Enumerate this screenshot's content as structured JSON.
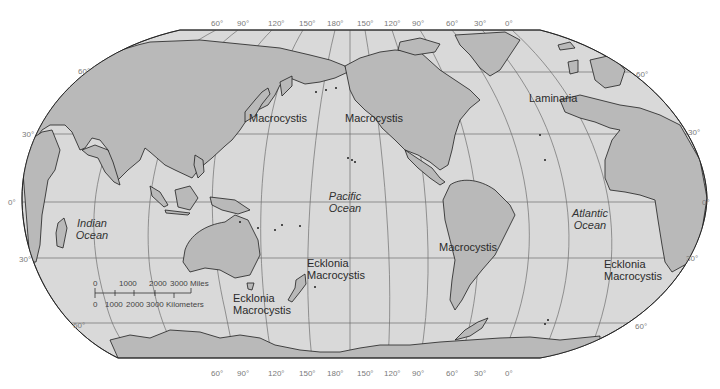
{
  "colors": {
    "ocean": "#d9d9d9",
    "land": "#b9b9b9",
    "coast": "#1e1e1e",
    "graticule": "#6e6e6e",
    "background": "#ffffff",
    "label": "#2a2a2a",
    "tick": "#7a7a7a"
  },
  "top_longitudes": [
    {
      "label": "60°",
      "x": 211,
      "y": 19
    },
    {
      "label": "90°",
      "x": 237,
      "y": 19
    },
    {
      "label": "120°",
      "x": 268,
      "y": 19
    },
    {
      "label": "150°",
      "x": 299,
      "y": 19
    },
    {
      "label": "180°",
      "x": 327,
      "y": 19
    },
    {
      "label": "150°",
      "x": 357,
      "y": 19
    },
    {
      "label": "120°",
      "x": 384,
      "y": 19
    },
    {
      "label": "90°",
      "x": 412,
      "y": 19
    },
    {
      "label": "60°",
      "x": 446,
      "y": 19
    },
    {
      "label": "30°",
      "x": 474,
      "y": 19
    },
    {
      "label": "0°",
      "x": 505,
      "y": 19
    }
  ],
  "bottom_longitudes": [
    {
      "label": "60°",
      "x": 211,
      "y": 369
    },
    {
      "label": "90°",
      "x": 237,
      "y": 369
    },
    {
      "label": "120°",
      "x": 268,
      "y": 369
    },
    {
      "label": "150°",
      "x": 299,
      "y": 369
    },
    {
      "label": "180°",
      "x": 327,
      "y": 369
    },
    {
      "label": "150°",
      "x": 357,
      "y": 369
    },
    {
      "label": "120°",
      "x": 384,
      "y": 369
    },
    {
      "label": "90°",
      "x": 412,
      "y": 369
    },
    {
      "label": "60°",
      "x": 446,
      "y": 369
    },
    {
      "label": "30°",
      "x": 474,
      "y": 369
    },
    {
      "label": "0°",
      "x": 505,
      "y": 369
    }
  ],
  "left_latitudes": [
    {
      "label": "60°",
      "x": 78,
      "y": 67
    },
    {
      "label": "30°",
      "x": 22,
      "y": 130
    },
    {
      "label": "0°",
      "x": 8,
      "y": 198
    },
    {
      "label": "30°",
      "x": 19,
      "y": 255
    },
    {
      "label": "60°",
      "x": 73,
      "y": 321
    }
  ],
  "right_latitudes": [
    {
      "label": "60°",
      "x": 636,
      "y": 70
    },
    {
      "label": "30°",
      "x": 688,
      "y": 128
    },
    {
      "label": "0°",
      "x": 702,
      "y": 198
    },
    {
      "label": "30°",
      "x": 686,
      "y": 254
    },
    {
      "label": "60°",
      "x": 635,
      "y": 322
    }
  ],
  "oceans": [
    {
      "name": "Indian Ocean",
      "line1": "Indian",
      "line2": "Ocean",
      "x": 92,
      "y": 217
    },
    {
      "name": "Pacific Ocean",
      "line1": "Pacific",
      "line2": "Ocean",
      "x": 345,
      "y": 190
    },
    {
      "name": "Atlantic Ocean",
      "line1": "Atlantic",
      "line2": "Ocean",
      "x": 590,
      "y": 207
    }
  ],
  "kelp_labels": [
    {
      "id": "macrocystis-japan",
      "lines": [
        "Macrocystis"
      ],
      "x": 249,
      "y": 112
    },
    {
      "id": "macrocystis-northpacific",
      "lines": [
        "Macrocystis"
      ],
      "x": 345,
      "y": 112
    },
    {
      "id": "laminaria-north-atlantic",
      "lines": [
        "Laminaria"
      ],
      "x": 529,
      "y": 92
    },
    {
      "id": "macrocystis-south-america",
      "lines": [
        "Macrocystis"
      ],
      "x": 439,
      "y": 241
    },
    {
      "id": "ecklonia-macrocystis-nz",
      "lines": [
        "Ecklonia",
        "Macrocystis"
      ],
      "x": 307,
      "y": 257
    },
    {
      "id": "ecklonia-macrocystis-australia",
      "lines": [
        "Ecklonia",
        "Macrocystis"
      ],
      "x": 233,
      "y": 292
    },
    {
      "id": "ecklonia-macrocystis-south-africa",
      "lines": [
        "Ecklonia",
        "Macrocystis"
      ],
      "x": 604,
      "y": 258
    }
  ],
  "scale_bar": {
    "miles_ticks": [
      "0",
      "1000",
      "2000",
      "3000 Miles"
    ],
    "km_ticks": [
      "0",
      "1000",
      "2000",
      "3000 Kilometers"
    ]
  }
}
